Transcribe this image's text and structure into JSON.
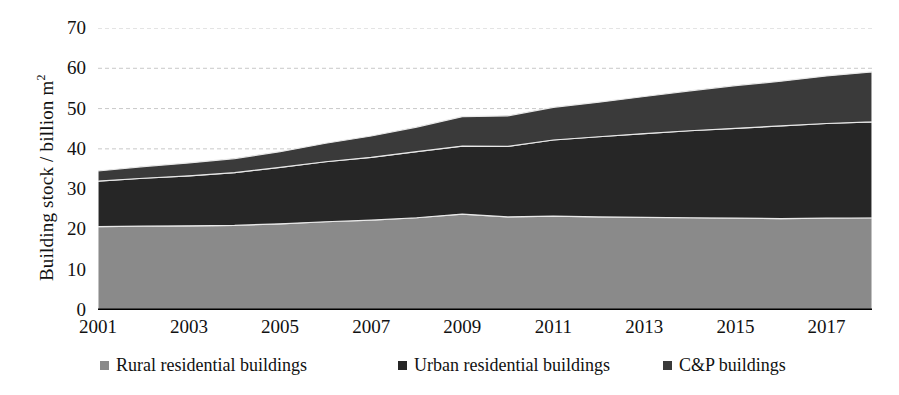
{
  "chart_data": {
    "type": "area",
    "stacked": true,
    "title": "",
    "xlabel": "",
    "ylabel": "Building stock  / billion m²",
    "ylim": [
      0,
      70
    ],
    "ytick_values": [
      0,
      10,
      20,
      30,
      40,
      50,
      60,
      70
    ],
    "ytick_labels": [
      "0",
      "10",
      "20",
      "30",
      "40",
      "50",
      "60",
      "70"
    ],
    "grid": true,
    "grid_style": "dashed-horizontal",
    "legend_position": "bottom",
    "x": [
      2001,
      2002,
      2003,
      2004,
      2005,
      2006,
      2007,
      2008,
      2009,
      2010,
      2011,
      2012,
      2013,
      2014,
      2015,
      2016,
      2017,
      2018
    ],
    "xtick_labels": [
      "2001",
      "2003",
      "2005",
      "2007",
      "2009",
      "2011",
      "2013",
      "2015",
      "2017"
    ],
    "xtick_values": [
      2001,
      2003,
      2005,
      2007,
      2009,
      2011,
      2013,
      2015,
      2017
    ],
    "series": [
      {
        "name": "Rural residential buildings",
        "color": "#8a8a8a",
        "values": [
          20.7,
          20.8,
          20.9,
          21.0,
          21.4,
          21.9,
          22.3,
          22.9,
          23.8,
          23.1,
          23.3,
          23.1,
          23.0,
          22.9,
          22.8,
          22.7,
          22.8,
          22.9
        ]
      },
      {
        "name": "Urban residential buildings",
        "color": "#262626",
        "values": [
          11.3,
          11.9,
          12.4,
          13.1,
          14.0,
          14.9,
          15.6,
          16.4,
          16.9,
          17.5,
          18.9,
          19.9,
          20.8,
          21.6,
          22.3,
          23.0,
          23.5,
          23.8
        ]
      },
      {
        "name": "C&P buildings",
        "color": "#3a3a3a",
        "values": [
          2.5,
          2.9,
          3.2,
          3.5,
          3.9,
          4.6,
          5.3,
          6.1,
          7.3,
          7.6,
          8.1,
          8.6,
          9.2,
          9.9,
          10.6,
          11.1,
          11.8,
          12.4
        ]
      }
    ],
    "totals": [
      34.5,
      35.6,
      36.5,
      37.6,
      39.3,
      41.4,
      43.2,
      45.4,
      48.0,
      48.2,
      50.3,
      51.6,
      53.0,
      54.4,
      55.7,
      56.8,
      58.1,
      59.1
    ]
  },
  "legend": {
    "items": [
      {
        "label": "Rural residential buildings",
        "color": "#8a8a8a",
        "left": 100
      },
      {
        "label": "Urban residential buildings",
        "color": "#262626",
        "left": 398
      },
      {
        "label": "C&P buildings",
        "color": "#3a3a3a",
        "left": 663
      }
    ]
  },
  "axis": {
    "y_title_main": "Building stock  / billion m",
    "y_title_sup": "2"
  }
}
